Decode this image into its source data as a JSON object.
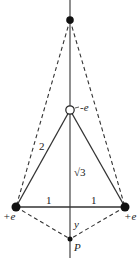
{
  "diagram": {
    "type": "charge-triangle",
    "charges": [
      {
        "id": "top-charge",
        "kind": "filled"
      },
      {
        "id": "center-charge",
        "label": "-e",
        "kind": "open"
      },
      {
        "id": "left-charge",
        "label": "+e",
        "kind": "filled"
      },
      {
        "id": "right-charge",
        "label": "+e",
        "kind": "filled"
      }
    ],
    "point": {
      "label": "P"
    },
    "labels": {
      "side": "2",
      "height": "√3",
      "half_base_left": "1",
      "half_base_right": "1",
      "distance": "y",
      "neg_charge": "-e",
      "pos_left": "+e",
      "pos_right": "+e",
      "point": "P"
    },
    "colors": {
      "line": "#333333",
      "dot": "#111111",
      "background": "#ffffff"
    }
  }
}
